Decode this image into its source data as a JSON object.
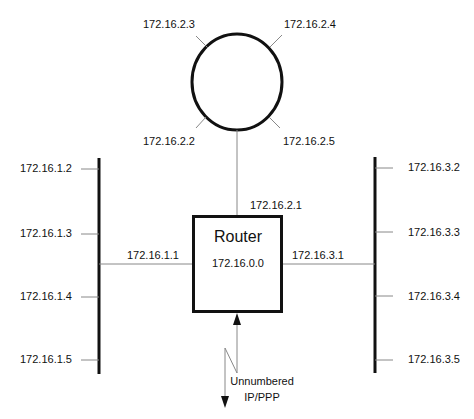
{
  "diagram": {
    "router": {
      "title": "Router",
      "network": "172.16.0.0",
      "ring_interface": "172.16.2.1",
      "left_interface": "172.16.1.1",
      "right_interface": "172.16.3.1"
    },
    "ring": {
      "hosts": [
        "172.16.2.3",
        "172.16.2.4",
        "172.16.2.2",
        "172.16.2.5"
      ]
    },
    "left_bus": {
      "hosts": [
        "172.16.1.2",
        "172.16.1.3",
        "172.16.1.4",
        "172.16.1.5"
      ]
    },
    "right_bus": {
      "hosts": [
        "172.16.3.2",
        "172.16.3.3",
        "172.16.3.4",
        "172.16.3.5"
      ]
    },
    "wan": {
      "line1": "Unnumbered",
      "line2": "IP/PPP"
    },
    "colors": {
      "thick_line": "#111111",
      "thin_line": "#888888"
    }
  }
}
